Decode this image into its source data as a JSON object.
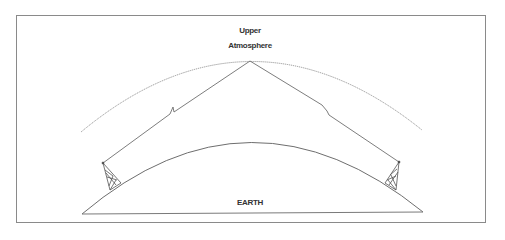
{
  "diagram": {
    "labels": {
      "upper_line1": "Upper",
      "upper_line2": "Atmosphere",
      "earth": "EARTH"
    },
    "nodes": [
      {
        "id": "upper-atmosphere",
        "label": "Upper Atmosphere",
        "type": "layer"
      },
      {
        "id": "earth",
        "label": "EARTH",
        "type": "surface"
      },
      {
        "id": "transmitter-tower-left",
        "label": "",
        "type": "antenna"
      },
      {
        "id": "receiver-tower-right",
        "label": "",
        "type": "antenna"
      }
    ],
    "edges": [
      {
        "from": "transmitter-tower-left",
        "to": "upper-atmosphere",
        "style": "signal-zigzag"
      },
      {
        "from": "upper-atmosphere",
        "to": "receiver-tower-right",
        "style": "signal-zigzag"
      }
    ],
    "colors": {
      "stroke": "#6e6e6e",
      "text": "#333333",
      "frame": "#8a8a8a",
      "background": "#ffffff"
    }
  }
}
